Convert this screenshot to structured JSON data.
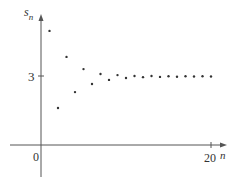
{
  "chart_data": {
    "type": "scatter",
    "title": "",
    "xlabel": "n",
    "ylabel": "s_n",
    "ylabel_main": "s",
    "ylabel_sub": "n",
    "x_ticks": [
      {
        "value": 0,
        "label": "0"
      },
      {
        "value": 20,
        "label": "20"
      }
    ],
    "y_ticks": [
      {
        "value": 3,
        "label": "3"
      }
    ],
    "xlim": [
      -4,
      22
    ],
    "ylim": [
      -4,
      6.3
    ],
    "grid": false,
    "legend": null,
    "series": [
      {
        "name": "s_n",
        "x": [
          1,
          2,
          3,
          4,
          5,
          6,
          7,
          8,
          9,
          10,
          11,
          12,
          13,
          14,
          15,
          16,
          17,
          18,
          19,
          20
        ],
        "values": [
          4.96,
          1.61,
          3.83,
          2.3,
          3.3,
          2.65,
          3.09,
          2.83,
          3.04,
          2.91,
          3.0,
          2.95,
          3.0,
          2.96,
          2.99,
          2.97,
          2.99,
          2.98,
          2.99,
          2.98
        ]
      }
    ]
  },
  "colors": {
    "axis": "#555555",
    "point": "#333333",
    "text": "#333333"
  }
}
